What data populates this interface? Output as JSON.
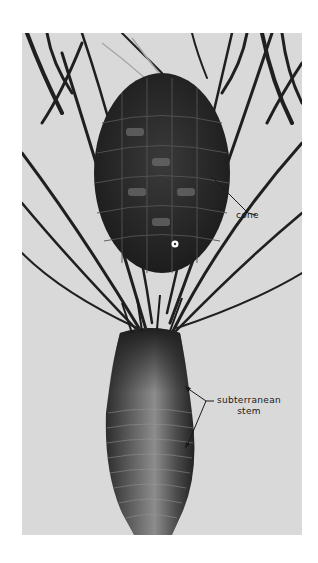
{
  "figure": {
    "labels": {
      "cone": "cone",
      "stem_line1": "subterranean",
      "stem_line2": "stem"
    },
    "colors": {
      "background": "#d9d9d9",
      "page": "#ffffff",
      "plant_dark": "#2a2a2a",
      "label_text": "#1a1a1a"
    }
  }
}
